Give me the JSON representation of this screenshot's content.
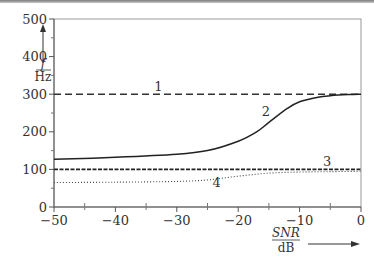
{
  "chart_data": {
    "type": "line",
    "title": "",
    "xlabel": "SNR / dB",
    "xlabel_num": "SNR",
    "xlabel_den": "dB",
    "ylabel": "f / Hz",
    "ylabel_num": "f",
    "ylabel_den": "Hz",
    "xlim": [
      -50,
      0
    ],
    "ylim": [
      0,
      500
    ],
    "xticks": [
      -50,
      -40,
      -30,
      -20,
      -10,
      0
    ],
    "xtick_labels": [
      "−50",
      "−40",
      "−30",
      "−20",
      "−10",
      "0"
    ],
    "yticks": [
      0,
      100,
      200,
      300,
      400,
      500
    ],
    "ytick_labels": [
      "0",
      "100",
      "200",
      "300",
      "400",
      "500"
    ],
    "grid": false,
    "series": [
      {
        "name": "1",
        "style": "dashed",
        "x": [
          -50,
          0
        ],
        "values": [
          300,
          300
        ],
        "label_pos": [
          -33,
          308
        ]
      },
      {
        "name": "2",
        "style": "solid",
        "x": [
          -50,
          -40,
          -30,
          -25,
          -20,
          -17,
          -15,
          -12,
          -10,
          -7,
          -5,
          -2,
          0
        ],
        "values": [
          127,
          132,
          140,
          150,
          175,
          200,
          225,
          262,
          280,
          292,
          296,
          299,
          300
        ],
        "label_pos": [
          -15.5,
          242
        ]
      },
      {
        "name": "3",
        "style": "dashed-fine",
        "x": [
          -50,
          0
        ],
        "values": [
          100,
          100
        ],
        "label_pos": [
          -5.5,
          108
        ]
      },
      {
        "name": "4",
        "style": "dotted",
        "x": [
          -50,
          -40,
          -30,
          -25,
          -20,
          -15,
          -10,
          -5,
          0
        ],
        "values": [
          65,
          66,
          68,
          72,
          82,
          90,
          93,
          94,
          95
        ],
        "label_pos": [
          -23.5,
          52
        ]
      }
    ]
  }
}
